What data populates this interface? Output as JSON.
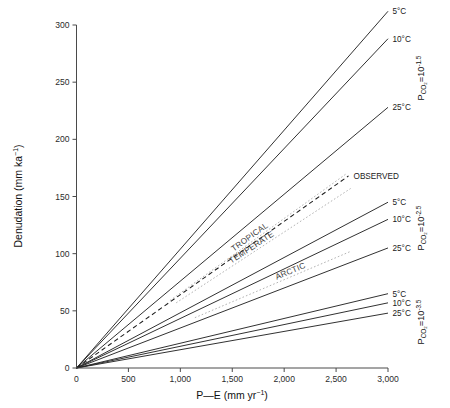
{
  "chart_data": {
    "type": "line",
    "title": "",
    "xlabel": "P—E (mm yr-1)",
    "ylabel": "Denudation (mm ka-1)",
    "xlim": [
      0,
      3000
    ],
    "ylim": [
      0,
      310
    ],
    "grid": false,
    "legend_position": "inline-right-of-line-ends",
    "x_ticks": [
      0,
      500,
      1000,
      1500,
      2000,
      2500,
      3000
    ],
    "x_tick_labels": [
      "0",
      "500",
      "1,000",
      "1,500",
      "2,000",
      "2,500",
      "3,000"
    ],
    "y_ticks": [
      0,
      50,
      100,
      150,
      200,
      250,
      300
    ],
    "y_tick_labels": [
      "0",
      "50",
      "100",
      "150",
      "200",
      "250",
      "300"
    ],
    "note": "All model lines are straight and pass through the origin (0,0). Values listed are denudation in mm/ka at the stated P-E in mm/yr.",
    "groups": [
      {
        "id": "pco2-1",
        "group_label_base": "P",
        "group_label_sub": "CO2",
        "group_label_eq": "=10",
        "group_label_exp": "-1.5",
        "group_label_plain": "PCO2=10-1.5",
        "series": [
          {
            "name": "5°C",
            "label": "5°C",
            "x_end": 3000,
            "y_end": 312,
            "slope": 0.104
          },
          {
            "name": "10°C",
            "label": "10°C",
            "x_end": 3000,
            "y_end": 288,
            "slope": 0.096
          },
          {
            "name": "25°C",
            "label": "25°C",
            "x_end": 3000,
            "y_end": 228,
            "slope": 0.076
          }
        ]
      },
      {
        "id": "pco2-2",
        "group_label_base": "P",
        "group_label_sub": "CO2",
        "group_label_eq": "=10",
        "group_label_exp": "-2.5",
        "group_label_plain": "PCO2=10-2.5",
        "series": [
          {
            "name": "5°C",
            "label": "5°C",
            "x_end": 3000,
            "y_end": 145,
            "slope": 0.0483
          },
          {
            "name": "10°C",
            "label": "10°C",
            "x_end": 3000,
            "y_end": 130,
            "slope": 0.0433
          },
          {
            "name": "25°C",
            "label": "25°C",
            "x_end": 3000,
            "y_end": 105,
            "slope": 0.035
          }
        ]
      },
      {
        "id": "pco2-3",
        "group_label_base": "P",
        "group_label_sub": "CO2",
        "group_label_eq": "=10",
        "group_label_exp": "-3.5",
        "group_label_plain": "PCO2=10-3.5",
        "series": [
          {
            "name": "5°C",
            "label": "5°C",
            "x_end": 3000,
            "y_end": 65,
            "slope": 0.0217
          },
          {
            "name": "10°C",
            "label": "10°C",
            "x_end": 3000,
            "y_end": 57,
            "slope": 0.019
          },
          {
            "name": "25°C",
            "label": "25°C",
            "x_end": 3000,
            "y_end": 48,
            "slope": 0.016
          }
        ]
      }
    ],
    "observed": {
      "name": "OBSERVED",
      "label": "OBSERVED",
      "style": "dashed",
      "color": "#1d1d1d",
      "x_start": 0,
      "y_start": 0,
      "x_end": 2620,
      "y_end": 168,
      "slope": 0.0641
    },
    "climate_zones": [
      {
        "name": "TROPICAL",
        "label": "TROPICAL",
        "style": "dotted",
        "color": "#b4b4b4",
        "x_start": 900,
        "y_start": 59,
        "x_end": 2600,
        "y_end": 170,
        "slope": 0.0654
      },
      {
        "name": "TEMPERATE",
        "label": "TEMPERATE",
        "style": "dotted",
        "color": "#b4b4b4",
        "x_start": 960,
        "y_start": 57,
        "x_end": 2640,
        "y_end": 157,
        "slope": 0.0595
      },
      {
        "name": "ARCTIC",
        "label": "ARCTIC",
        "style": "dotted",
        "color": "#b4b4b4",
        "x_start": 1140,
        "y_start": 44,
        "x_end": 2640,
        "y_end": 102,
        "slope": 0.0386
      }
    ]
  }
}
